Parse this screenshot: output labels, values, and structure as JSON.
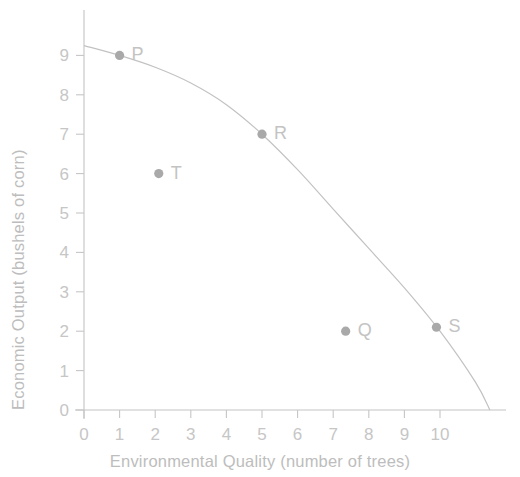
{
  "chart_data": {
    "type": "scatter",
    "title": "",
    "subtitle": "",
    "xlabel": "Environmental Quality (number of trees)",
    "ylabel": "Economic Output (bushels of corn)",
    "xlim": [
      0,
      11.7
    ],
    "ylim": [
      0,
      9.6
    ],
    "xticks": [
      "0",
      "1",
      "2",
      "3",
      "4",
      "5",
      "6",
      "7",
      "8",
      "9",
      "10"
    ],
    "xtick_values": [
      0,
      1,
      2,
      3,
      4,
      5,
      6,
      7,
      8,
      9,
      10
    ],
    "yticks": [
      "0",
      "1",
      "2",
      "3",
      "4",
      "5",
      "6",
      "7",
      "8",
      "9"
    ],
    "ytick_values": [
      0,
      1,
      2,
      3,
      4,
      5,
      6,
      7,
      8,
      9
    ],
    "grid": false,
    "legend": false,
    "points": [
      {
        "label": "P",
        "x": 1.0,
        "y": 9.0,
        "on_curve": true
      },
      {
        "label": "T",
        "x": 2.1,
        "y": 6.0,
        "on_curve": false
      },
      {
        "label": "R",
        "x": 5.0,
        "y": 7.0,
        "on_curve": true
      },
      {
        "label": "Q",
        "x": 7.35,
        "y": 2.0,
        "on_curve": false
      },
      {
        "label": "S",
        "x": 9.9,
        "y": 2.1,
        "on_curve": true
      }
    ],
    "series": [
      {
        "name": "Production Possibilities Frontier",
        "type": "line",
        "curve_points": [
          {
            "x": 0.0,
            "y": 9.25
          },
          {
            "x": 1.0,
            "y": 9.0
          },
          {
            "x": 2.0,
            "y": 8.7
          },
          {
            "x": 3.0,
            "y": 8.3
          },
          {
            "x": 4.0,
            "y": 7.75
          },
          {
            "x": 5.0,
            "y": 7.0
          },
          {
            "x": 6.0,
            "y": 6.1
          },
          {
            "x": 7.0,
            "y": 5.1
          },
          {
            "x": 8.0,
            "y": 4.1
          },
          {
            "x": 9.0,
            "y": 3.1
          },
          {
            "x": 10.0,
            "y": 2.0
          },
          {
            "x": 11.0,
            "y": 0.7
          },
          {
            "x": 11.4,
            "y": 0.0
          }
        ]
      }
    ],
    "colors": {
      "axis": "#c4c4c4",
      "curve": "#c2c2c2",
      "point": "#a9a9a9",
      "text": "#bdbdbd",
      "background": "#ffffff"
    }
  }
}
